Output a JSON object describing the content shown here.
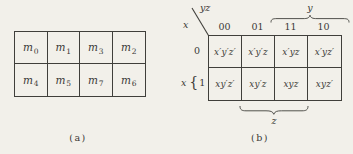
{
  "colors": {
    "background": "#f2f0ea",
    "ink": "#3a3936"
  },
  "fig_a": {
    "symbol": "m",
    "subscripts": [
      [
        "0",
        "1",
        "3",
        "2"
      ],
      [
        "4",
        "5",
        "7",
        "6"
      ]
    ],
    "caption": "(a)"
  },
  "fig_b": {
    "corner_top_label": "yz",
    "corner_side_label": "x",
    "col_headers": [
      "00",
      "01",
      "11",
      "10"
    ],
    "row_labels": [
      "0",
      "1"
    ],
    "row_group_label": "x",
    "row_group_brace": "{",
    "top_brace_label": "y",
    "bottom_brace_label": "z",
    "cells": [
      [
        "x′y′z′",
        "x′y′z",
        "x′yz",
        "x′yz′"
      ],
      [
        "xy′z′",
        "xy′z",
        "xyz",
        "xyz′"
      ]
    ],
    "caption": "(b)"
  }
}
